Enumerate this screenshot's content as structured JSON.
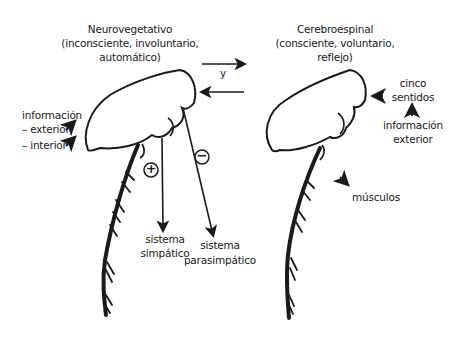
{
  "left_system": {
    "title": "Neurovegetativo",
    "subtitle_line1": "(inconsciente, involuntario,",
    "subtitle_line2": "automático)",
    "input_label": "información",
    "input_exterior": "– exterior",
    "input_interior": "– interior",
    "sympathetic_sign": "+",
    "parasympathetic_sign": "−",
    "sympathetic_label_1": "sistema",
    "sympathetic_label_2": "simpático",
    "parasympathetic_label_1": "sistema",
    "parasympathetic_label_2": "parasimpático"
  },
  "connector": {
    "label": "y"
  },
  "right_system": {
    "title": "Cerebroespinal",
    "subtitle_line1": "(consciente, voluntario,",
    "subtitle_line2": "reflejo)",
    "senses_line1": "cinco",
    "senses_line2": "sentidos",
    "info_line1": "información",
    "info_line2": "exterior",
    "output_label": "músculos"
  },
  "colors": {
    "ink": "#1a1a1a",
    "background": "#ffffff"
  }
}
